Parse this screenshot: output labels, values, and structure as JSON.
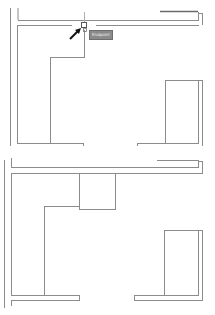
{
  "app": {
    "type": "cad-floor-plan-viewport",
    "panels": [
      {
        "id": "top",
        "description": "floor plan with object snap active"
      },
      {
        "id": "bottom",
        "description": "floor plan after edit (box added)"
      }
    ]
  },
  "snap": {
    "tooltip_label": "Endpoint",
    "marker": "snap-endpoint-square",
    "cursor": "pick-arrow"
  },
  "colors": {
    "line": "#8c8c8c",
    "line_dark": "#6a6a6a",
    "background": "#ffffff",
    "tooltip_bg": "#8a8a8a",
    "tooltip_text": "#f2f2f2",
    "cursor": "#111111"
  }
}
